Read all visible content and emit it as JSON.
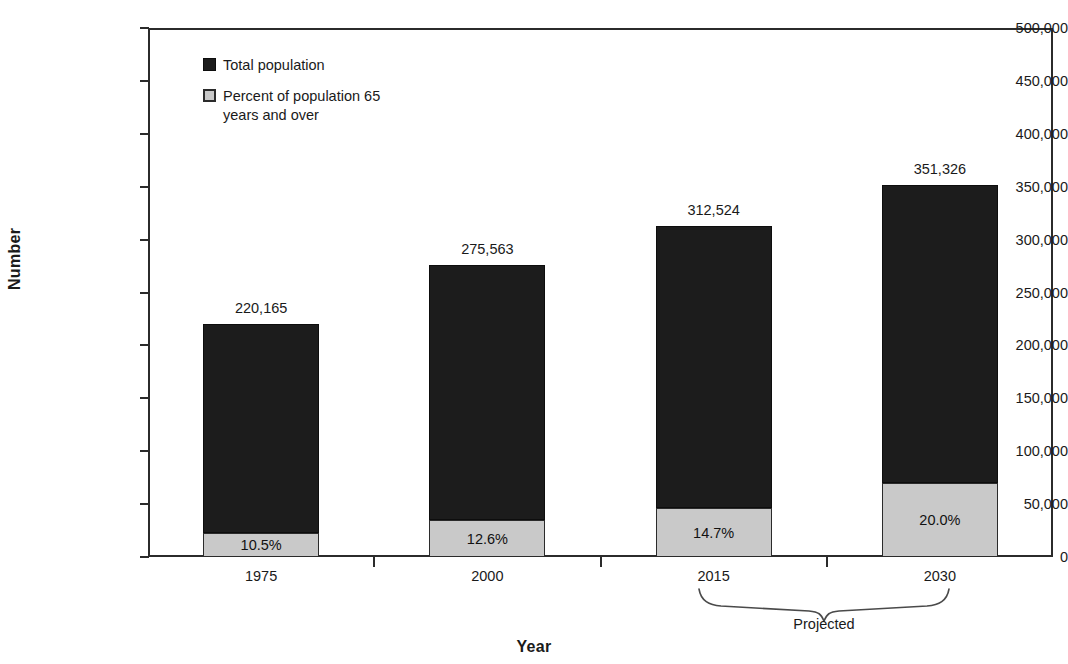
{
  "chart_data": {
    "type": "bar",
    "title": "",
    "subtitle": "",
    "xlabel": "Year",
    "ylabel": "Number",
    "categories": [
      "1975",
      "2000",
      "2015",
      "2030"
    ],
    "ylim": [
      0,
      500000
    ],
    "ytick_values": [
      0,
      50000,
      100000,
      150000,
      200000,
      250000,
      300000,
      350000,
      400000,
      450000,
      500000
    ],
    "ytick_labels": [
      "0",
      "50,000",
      "100,000",
      "150,000",
      "200,000",
      "250,000",
      "300,000",
      "350,000",
      "400,000",
      "450,000",
      "500,000"
    ],
    "grid": false,
    "legend_position": "upper-left-inside",
    "stacked": true,
    "series": [
      {
        "name": "Total population",
        "color": "#1c1c1c",
        "values": [
          220165,
          275563,
          312524,
          351326
        ],
        "value_labels": [
          "220,165",
          "275,563",
          "312,524",
          "351,326"
        ]
      },
      {
        "name": "Percent of population 65 years and over",
        "color": "#c9c9c9",
        "values": [
          10.5,
          12.6,
          14.7,
          20.0
        ],
        "value_labels": [
          "10.5%",
          "12.6%",
          "14.7%",
          "20.0%"
        ],
        "unit": "percent-of-total"
      }
    ],
    "annotations": [
      {
        "type": "brace",
        "label": "Projected",
        "spans_categories": [
          "2015",
          "2030"
        ]
      }
    ]
  },
  "axes": {
    "y": {
      "title": "Number",
      "ticks": [
        {
          "label": "500,000",
          "value": 500000
        },
        {
          "label": "450,000",
          "value": 450000
        },
        {
          "label": "400,000",
          "value": 400000
        },
        {
          "label": "350,000",
          "value": 350000
        },
        {
          "label": "300,000",
          "value": 300000
        },
        {
          "label": "250,000",
          "value": 250000
        },
        {
          "label": "200,000",
          "value": 200000
        },
        {
          "label": "150,000",
          "value": 150000
        },
        {
          "label": "100,000",
          "value": 100000
        },
        {
          "label": "50,000",
          "value": 50000
        },
        {
          "label": "0",
          "value": 0
        }
      ]
    },
    "x": {
      "title": "Year",
      "ticks": [
        {
          "label": "1975"
        },
        {
          "label": "2000"
        },
        {
          "label": "2015"
        },
        {
          "label": "2030"
        }
      ]
    }
  },
  "legend": {
    "items": [
      {
        "label": "Total population",
        "color": "#1c1c1c",
        "swatch": "legend-swatch-total"
      },
      {
        "label": "Percent of population 65 years and over",
        "color": "#c9c9c9",
        "swatch": "legend-swatch-elderly"
      }
    ]
  },
  "bars": [
    {
      "category": "1975",
      "total_label": "220,165",
      "pct_label": "10.5%"
    },
    {
      "category": "2000",
      "total_label": "275,563",
      "pct_label": "12.6%"
    },
    {
      "category": "2015",
      "total_label": "312,524",
      "pct_label": "14.7%"
    },
    {
      "category": "2030",
      "total_label": "351,326",
      "pct_label": "20.0%"
    }
  ],
  "annotation": {
    "projected_label": "Projected"
  },
  "colors": {
    "total": "#1c1c1c",
    "elderly": "#c9c9c9",
    "axis": "#2b2b2b",
    "text": "#1a1a1a",
    "background": "#ffffff"
  }
}
